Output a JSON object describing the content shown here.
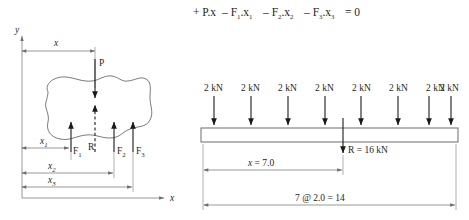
{
  "figure": {
    "equation": "+ P.x – F₁.x₁ – F₂.x₂ – F₃.x₃ = 0",
    "equation_parts": {
      "term1": "+ P.x",
      "term2": "– F",
      "term2_sub": "1",
      "term2_var": ".x",
      "term2_var_sub": "1",
      "term3": "– F",
      "term3_sub": "2",
      "term3_var": ".x",
      "term3_var_sub": "2",
      "term4": "– F",
      "term4_sub": "3",
      "term4_var": ".x",
      "term4_var_sub": "3",
      "equals": "= 0"
    }
  },
  "left_diagram": {
    "name": "resultant-of-parallel-forces-body",
    "axes": {
      "y_label": "y",
      "x_label": "x"
    },
    "applied_force_label": "P",
    "resultant_label": "R",
    "forces": [
      {
        "label": "F",
        "sub": "1"
      },
      {
        "label": "F",
        "sub": "2"
      },
      {
        "label": "F",
        "sub": "3"
      }
    ],
    "dimensions": [
      {
        "label": "x",
        "sub": ""
      },
      {
        "label": "x",
        "sub": "1"
      },
      {
        "label": "x",
        "sub": "2"
      },
      {
        "label": "x",
        "sub": "3"
      }
    ]
  },
  "right_diagram": {
    "name": "beam-with-eight-point-loads",
    "loads": [
      {
        "label": "2 kN"
      },
      {
        "label": "2 kN"
      },
      {
        "label": "2 kN"
      },
      {
        "label": "2 kN"
      },
      {
        "label": "2 kN"
      },
      {
        "label": "2 kN"
      },
      {
        "label": "2 kN"
      },
      {
        "label": "2 kN"
      }
    ],
    "resultant_label": "R = 16 kN",
    "x_dimension_label_italic": "x",
    "x_dimension_label_value": " = 7.0",
    "span_dimension_label": "7 @ 2.0 = 14"
  },
  "colors": {
    "background": "#ffffff",
    "ink": "#1a1a1a",
    "thin_line": "#6d6d6d",
    "blob_line": "#585858"
  }
}
